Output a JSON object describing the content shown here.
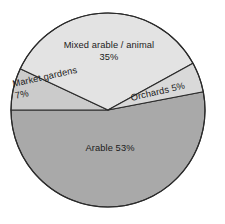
{
  "chart_data": {
    "type": "pie",
    "title": "",
    "subtitle": "",
    "xlabel": "",
    "ylabel": "",
    "legend": "none",
    "grid": false,
    "labels_inside": true,
    "total_percent": 100,
    "categories": [
      "Mixed arable / animal",
      "Orchards",
      "Arable",
      "Market gardens"
    ],
    "values": [
      35,
      5,
      53,
      7
    ],
    "slices": [
      {
        "name": "Mixed arable / animal",
        "label": "Mixed arable / animal",
        "value": 35,
        "value_text": "35%",
        "color": "#e3e3e3",
        "start_angle_deg": 205.2,
        "end_angle_deg": 331.2,
        "sweep_deg": 126.0,
        "label_rotation_deg": 0
      },
      {
        "name": "Orchards",
        "label": "Orchards",
        "value": 5,
        "value_text": "5%",
        "combined_text": "Orchards 5%",
        "color": "#d9d9d9",
        "start_angle_deg": 331.2,
        "end_angle_deg": 349.2,
        "sweep_deg": 18.0,
        "label_rotation_deg": -13
      },
      {
        "name": "Arable",
        "label": "Arable",
        "value": 53,
        "value_text": "53%",
        "combined_text": "Arable 53%",
        "color": "#a9a9a9",
        "start_angle_deg": 349.2,
        "end_angle_deg": 180.0,
        "sweep_deg": 190.8,
        "label_rotation_deg": 0
      },
      {
        "name": "Market gardens",
        "label": "Market gardens",
        "value": 7,
        "value_text": "7%",
        "color": "#cbcbcb",
        "start_angle_deg": 180.0,
        "end_angle_deg": 205.2,
        "sweep_deg": 25.2,
        "label_rotation_deg": -12.6
      }
    ],
    "colors": {
      "mixed_arable_animal": "#e3e3e3",
      "orchards": "#d9d9d9",
      "arable": "#a9a9a9",
      "market_gardens": "#cbcbcb",
      "outline": "#2b2b2b",
      "background": "#ffffff",
      "text": "#1b1b1b"
    },
    "geometry": {
      "center_x": 108,
      "center_y": 110,
      "radius": 97,
      "stroke_width": 1.1
    }
  },
  "labels": {
    "mixed": {
      "text": "Mixed arable / animal",
      "value": "35%"
    },
    "market": {
      "text": "Market gardens",
      "value": "7%"
    },
    "orchards": {
      "text": "Orchards 5%"
    },
    "arable": {
      "text": "Arable 53%"
    }
  }
}
